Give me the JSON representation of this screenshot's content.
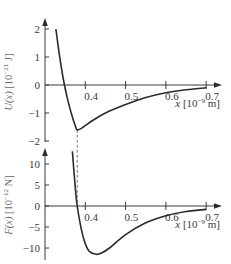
{
  "chart_data": [
    {
      "type": "line",
      "title": "",
      "ylabel": "U(x) [10^-21 J]",
      "ylabel_parts": {
        "fn": "U(x)",
        "unit_open": " [10",
        "exp": "−21",
        "unit_close": " J]"
      },
      "xlabel": "x [10^-9 m]",
      "xlabel_parts": {
        "var": "x",
        "unit_open": " [10",
        "exp": "−9",
        "unit_close": " m]"
      },
      "xlim": [
        0.3,
        0.735
      ],
      "ylim": [
        -2.0,
        2.3
      ],
      "x_ticks": [
        0.4,
        0.5,
        0.6,
        0.7
      ],
      "x_tick_labels": [
        "0.4",
        "0.5",
        "0.6",
        "0.7"
      ],
      "y_ticks": [
        2,
        1,
        0,
        -1,
        -2
      ],
      "y_tick_labels": [
        "2",
        "1",
        "0",
        "−1",
        "−2"
      ],
      "grid": false,
      "annotations": [
        {
          "type": "dashed-vline",
          "x": 0.38,
          "label": "equilibrium separation"
        }
      ],
      "series": [
        {
          "name": "U(x)",
          "x": [
            0.327,
            0.335,
            0.345,
            0.355,
            0.365,
            0.375,
            0.38,
            0.39,
            0.4,
            0.42,
            0.45,
            0.5,
            0.55,
            0.6,
            0.65,
            0.7
          ],
          "values": [
            2.0,
            1.15,
            0.25,
            -0.45,
            -1.0,
            -1.45,
            -1.6,
            -1.55,
            -1.45,
            -1.25,
            -1.0,
            -0.7,
            -0.45,
            -0.28,
            -0.17,
            -0.1
          ]
        }
      ]
    },
    {
      "type": "line",
      "title": "",
      "ylabel": "F(x) [10^-12 N]",
      "ylabel_parts": {
        "fn": "F(x)",
        "unit_open": " [10",
        "exp": "−12",
        "unit_close": " N]"
      },
      "xlabel": "x [10^-9 m]",
      "xlabel_parts": {
        "var": "x",
        "unit_open": " [10",
        "exp": "−9",
        "unit_close": " m]"
      },
      "xlim": [
        0.3,
        0.735
      ],
      "ylim": [
        -12.5,
        14
      ],
      "x_ticks": [
        0.4,
        0.5,
        0.6,
        0.7
      ],
      "x_tick_labels": [
        "0.4",
        "0.5",
        "0.6",
        "0.7"
      ],
      "y_ticks": [
        10,
        5,
        0,
        -5,
        -10
      ],
      "y_tick_labels": [
        "10",
        "5",
        "0",
        "−5",
        "−10"
      ],
      "grid": false,
      "series": [
        {
          "name": "F(x)",
          "x": [
            0.368,
            0.372,
            0.376,
            0.38,
            0.39,
            0.4,
            0.41,
            0.427,
            0.44,
            0.46,
            0.5,
            0.55,
            0.6,
            0.65,
            0.7
          ],
          "values": [
            13.0,
            8.0,
            3.5,
            0.0,
            -5.5,
            -9.0,
            -10.8,
            -11.5,
            -11.2,
            -10.0,
            -6.8,
            -4.0,
            -2.3,
            -1.3,
            -0.8
          ]
        }
      ]
    }
  ],
  "layout": {
    "line_color": "#2b2b2b",
    "axis_color": "#3a3a3a",
    "ylabel_color": "#707070",
    "top": {
      "x0_px": 45,
      "x_per_unit": 403,
      "x_min": 0.3,
      "y0_px": 85,
      "y_per_unit": 28,
      "y_axis_top": 20,
      "y_axis_bottom": 142,
      "x_axis_right": 222
    },
    "bottom": {
      "x0_px": 45,
      "x_per_unit": 403,
      "x_min": 0.3,
      "y0_px": 206,
      "y_per_unit": 4.2,
      "y_axis_top": 148,
      "y_axis_bottom": 260,
      "x_axis_right": 222
    }
  }
}
